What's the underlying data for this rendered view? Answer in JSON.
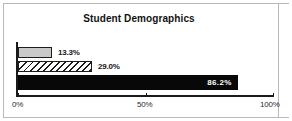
{
  "chart_data": {
    "type": "bar",
    "orientation": "horizontal",
    "title": "Student Demographics",
    "xlabel": "",
    "ylabel": "",
    "xlim": [
      0,
      100
    ],
    "grid": false,
    "legend": "none",
    "categories": [
      "Series 1",
      "Series 2",
      "Series 3"
    ],
    "values": [
      13.3,
      29.0,
      86.2
    ],
    "value_labels": [
      "13.3%",
      "29.0%",
      "86.2%"
    ],
    "bars": [
      {
        "value": 13.3,
        "label": "13.3%",
        "fill": "solid-light-gray",
        "fill_color": "#c9c9c9",
        "border_color": "#1c1c1c",
        "label_position": "outside",
        "label_color": "#151515"
      },
      {
        "value": 29.0,
        "label": "29.0%",
        "fill": "diagonal-hatch",
        "fill_color": "#ffffff",
        "border_color": "#1c1c1c",
        "label_position": "outside",
        "label_color": "#151515"
      },
      {
        "value": 86.2,
        "label": "86.2%",
        "fill": "solid-black",
        "fill_color": "#080808",
        "border_color": "#080808",
        "label_position": "inside",
        "label_color": "#ffffff"
      }
    ],
    "xticks": [
      0,
      50,
      100
    ],
    "xtick_labels": [
      "0%",
      "50%",
      "100%"
    ]
  },
  "colors": {
    "background": "#ffffff",
    "frame": "#b9b9b9",
    "axis": "#1a1a1a",
    "title": "#121212"
  }
}
